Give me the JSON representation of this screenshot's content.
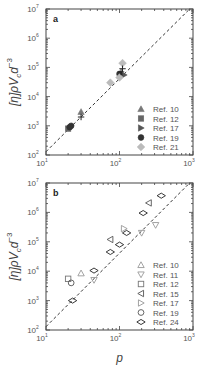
{
  "chart_data": [
    {
      "type": "scatter",
      "panel_label": "a",
      "xlabel": "",
      "ylabel": "[η]ρV_c d^-3",
      "xscale": "log",
      "yscale": "log",
      "xlim": [
        10,
        1000
      ],
      "ylim": [
        100,
        10000000
      ],
      "x_ticks": [
        "10^1",
        "10^2",
        "10^3"
      ],
      "y_ticks": [
        "10^2",
        "10^3",
        "10^4",
        "10^5",
        "10^6",
        "10^7"
      ],
      "grid": false,
      "legend_position": "lower right",
      "reference_line": {
        "style": "dashed",
        "slope_log": 2.5,
        "x": [
          10,
          1000
        ],
        "y": [
          130,
          13000000
        ]
      },
      "series": [
        {
          "name": "Ref. 10",
          "marker": "filled-triangle-up",
          "color": "#777777",
          "points": [
            [
              30,
              3000
            ]
          ]
        },
        {
          "name": "Ref. 12",
          "marker": "filled-square",
          "color": "#666666",
          "points": [
            [
              20,
              800
            ]
          ]
        },
        {
          "name": "Ref. 17",
          "marker": "filled-triangle-right",
          "color": "#555555",
          "points": [
            [
              115,
              55000
            ]
          ]
        },
        {
          "name": "Ref. 19",
          "marker": "filled-circle",
          "color": "#333333",
          "points": [
            [
              21,
              900
            ],
            [
              22,
              1000
            ],
            [
              100,
              60000
            ]
          ]
        },
        {
          "name": "Ref. 21",
          "marker": "filled-diamond",
          "color": "#bbbbbb",
          "points": [
            [
              75,
              30000
            ],
            [
              100,
              45000
            ],
            [
              110,
              140000
            ]
          ]
        },
        {
          "name": "unlabeled-plus",
          "marker": "plus",
          "color": "#222222",
          "points": [
            [
              30,
              2000
            ],
            [
              110,
              90000
            ],
            [
              105,
              70000
            ]
          ]
        }
      ]
    },
    {
      "type": "scatter",
      "panel_label": "b",
      "xlabel": "p",
      "ylabel": "[η]ρV_c d^-3",
      "xscale": "log",
      "yscale": "log",
      "xlim": [
        10,
        1000
      ],
      "ylim": [
        100,
        10000000
      ],
      "x_ticks": [
        "10^1",
        "10^2",
        "10^3"
      ],
      "y_ticks": [
        "10^2",
        "10^3",
        "10^4",
        "10^5",
        "10^6",
        "10^7"
      ],
      "grid": false,
      "legend_position": "lower right",
      "reference_line": {
        "style": "dashed",
        "slope_log": 2.5,
        "x": [
          10,
          1000
        ],
        "y": [
          130,
          13000000
        ]
      },
      "series": [
        {
          "name": "Ref. 10",
          "marker": "open-triangle-up",
          "color": "#999999",
          "points": [
            [
              30,
              8500
            ]
          ]
        },
        {
          "name": "Ref. 11",
          "marker": "open-triangle-down",
          "color": "#999999",
          "points": [
            [
              45,
              5000
            ],
            [
              200,
              200000
            ],
            [
              310,
              370000
            ]
          ]
        },
        {
          "name": "Ref. 12",
          "marker": "open-square",
          "color": "#777777",
          "points": [
            [
              20,
              5500
            ]
          ]
        },
        {
          "name": "Ref. 15",
          "marker": "open-triangle-left",
          "color": "#555555",
          "points": [
            [
              75,
              120000
            ],
            [
              250,
              2100000
            ]
          ]
        },
        {
          "name": "Ref. 17",
          "marker": "open-triangle-right",
          "color": "#999999",
          "points": [
            [
              115,
              280000
            ]
          ]
        },
        {
          "name": "Ref. 19",
          "marker": "open-circle",
          "color": "#555555",
          "points": [
            [
              22,
              4000
            ]
          ]
        },
        {
          "name": "Ref. 24",
          "marker": "open-diamond-wide",
          "color": "#222222",
          "points": [
            [
              23,
              1000
            ],
            [
              45,
              10500
            ],
            [
              75,
              45000
            ],
            [
              100,
              80000
            ],
            [
              125,
              200000
            ],
            [
              210,
              950000
            ],
            [
              370,
              3700000
            ]
          ]
        }
      ]
    }
  ],
  "panels": {
    "a": {
      "label": "a",
      "ylabel_main": "[η]ρV",
      "ylabel_sub": "c",
      "ylabel_tail": "d",
      "ylabel_exp": "−3",
      "legend": [
        "Ref. 10",
        "Ref. 12",
        "Ref. 17",
        "Ref. 19",
        "Ref. 21"
      ]
    },
    "b": {
      "label": "b",
      "ylabel_main": "[η]ρV",
      "ylabel_sub": "c",
      "ylabel_tail": "d",
      "ylabel_exp": "−3",
      "xlabel": "p",
      "legend": [
        "Ref. 10",
        "Ref. 11",
        "Ref. 12",
        "Ref. 15",
        "Ref. 17",
        "Ref. 19",
        "Ref. 24"
      ]
    }
  },
  "ticks": {
    "base": "10",
    "x_exps": [
      "1",
      "2",
      "3"
    ],
    "y_exps": [
      "2",
      "3",
      "4",
      "5",
      "6",
      "7"
    ]
  }
}
